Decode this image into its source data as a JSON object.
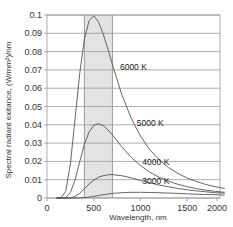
{
  "chart_data": {
    "type": "line",
    "title": "",
    "xlabel": "Wavelength, nm",
    "ylabel": "Spectral radiant exitance, (W/mm²)/nm",
    "xlim": [
      0,
      2000
    ],
    "ylim": [
      0,
      0.1
    ],
    "x_ticks": [
      "0",
      "500",
      "1000",
      "1500",
      "2000"
    ],
    "y_ticks": [
      "0",
      "0.01",
      "0.02",
      "0.03",
      "0.04",
      "0.05",
      "0.06",
      "0.07",
      "0.08",
      "0.09",
      "0.1"
    ],
    "grid": "horizontal",
    "shaded_region": {
      "label": "visible band",
      "x_start": 400,
      "x_end": 700,
      "color": "#e6e6e6"
    },
    "x": [
      100,
      150,
      200,
      250,
      300,
      350,
      400,
      450,
      500,
      550,
      600,
      650,
      700,
      800,
      900,
      1000,
      1100,
      1200,
      1300,
      1400,
      1500,
      1600,
      1700,
      1800,
      1900
    ],
    "series": [
      {
        "name": "6000 K",
        "values": [
          0.0,
          0.0001,
          0.0036,
          0.0187,
          0.043,
          0.068,
          0.0869,
          0.0969,
          0.0995,
          0.0964,
          0.0898,
          0.0815,
          0.0727,
          0.0565,
          0.0436,
          0.0338,
          0.0264,
          0.0208,
          0.0166,
          0.0134,
          0.0109,
          0.009,
          0.0074,
          0.0062,
          0.0052
        ]
      },
      {
        "name": "5000 K",
        "values": [
          0.0,
          0.0,
          0.0003,
          0.0029,
          0.0098,
          0.0198,
          0.0294,
          0.0361,
          0.0397,
          0.0406,
          0.0396,
          0.0373,
          0.0344,
          0.028,
          0.0222,
          0.0177,
          0.0141,
          0.0113,
          0.0092,
          0.0075,
          0.0062,
          0.0051,
          0.0043,
          0.0036,
          0.0031
        ]
      },
      {
        "name": "4000 K",
        "values": [
          0.0,
          0.0,
          0.0,
          0.0001,
          0.0008,
          0.0025,
          0.005,
          0.0077,
          0.0098,
          0.0113,
          0.0122,
          0.0127,
          0.0128,
          0.0122,
          0.011,
          0.0096,
          0.0083,
          0.0071,
          0.0061,
          0.0052,
          0.0045,
          0.0039,
          0.0034,
          0.0029,
          0.0026
        ]
      },
      {
        "name": "3000 K",
        "values": [
          0.0,
          0.0,
          0.0,
          0.0,
          0.0,
          0.0001,
          0.0002,
          0.0005,
          0.0009,
          0.0013,
          0.0018,
          0.0022,
          0.0025,
          0.0029,
          0.0031,
          0.0031,
          0.003,
          0.0029,
          0.0027,
          0.0025,
          0.0023,
          0.0021,
          0.0019,
          0.0018,
          0.0016
        ]
      }
    ],
    "annotations": [
      {
        "text": "6000 K",
        "x": 780,
        "y": 0.07
      },
      {
        "text": "5000 K",
        "x": 960,
        "y": 0.0395
      },
      {
        "text": "4000 K",
        "x": 1020,
        "y": 0.0183
      },
      {
        "text": "3000 K",
        "x": 1020,
        "y": 0.0078
      }
    ],
    "colors": {
      "line": "#555555",
      "grid": "#9a9a9a",
      "frame": "#9a9a9a",
      "shade": "#e3e3e3",
      "shade_edge": "#888888"
    }
  }
}
